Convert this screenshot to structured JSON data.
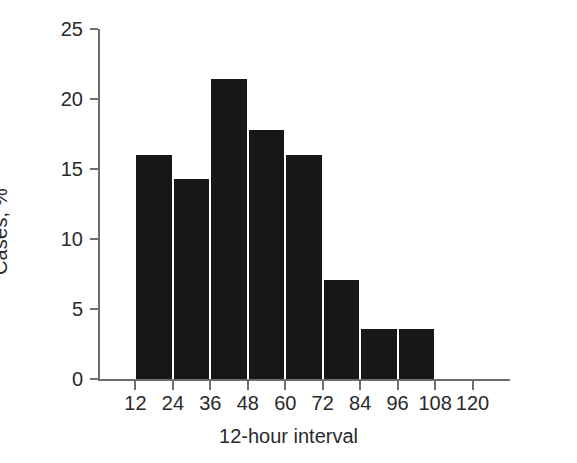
{
  "chart_data": {
    "type": "bar",
    "title": "",
    "xlabel": "12-hour interval",
    "ylabel": "Cases, %",
    "categories": [
      "12",
      "24",
      "36",
      "48",
      "60",
      "72",
      "84",
      "96",
      "108",
      "120"
    ],
    "values": [
      0,
      16.0,
      14.3,
      21.4,
      17.8,
      16.0,
      7.1,
      3.6,
      3.6,
      0
    ],
    "bars": [
      {
        "category": "24",
        "value": 16.0
      },
      {
        "category": "36",
        "value": 14.3
      },
      {
        "category": "48",
        "value": 21.4
      },
      {
        "category": "60",
        "value": 17.8
      },
      {
        "category": "72",
        "value": 16.0
      },
      {
        "category": "84",
        "value": 7.1
      },
      {
        "category": "96",
        "value": 3.6
      },
      {
        "category": "108",
        "value": 3.6
      }
    ],
    "xlim": [
      0,
      132
    ],
    "ylim": [
      0,
      25
    ],
    "yticks": [
      0,
      5,
      10,
      15,
      20,
      25
    ],
    "ytick_labels": [
      "0",
      "5",
      "10",
      "15",
      "20",
      "25"
    ],
    "xticks": [
      12,
      24,
      36,
      48,
      60,
      72,
      84,
      96,
      108,
      120
    ],
    "xtick_labels": [
      "12",
      "24",
      "36",
      "48",
      "60",
      "72",
      "84",
      "96",
      "108",
      "120"
    ],
    "grid": false,
    "legend": null,
    "bar_color": "#171717",
    "axis_color": "#6d6d6d",
    "background": "#ffffff"
  }
}
